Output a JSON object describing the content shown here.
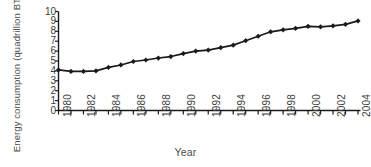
{
  "chart_data": {
    "type": "line",
    "title": "",
    "xlabel": "Year",
    "ylabel": "Energy consumption (quadrillion BTU)",
    "ylabel_lines": [
      "Energy consumption",
      "(quadrillion BTU)"
    ],
    "ylim": [
      0,
      10
    ],
    "xlim": [
      1980,
      2004
    ],
    "grid": false,
    "legend": null,
    "marker": "diamond",
    "line_color": "#1a1a1a",
    "marker_color": "#1a1a1a",
    "y_ticks": [
      10,
      9,
      8,
      7,
      6,
      5,
      4,
      3,
      2,
      1,
      0
    ],
    "x_ticks": [
      1980,
      1982,
      1984,
      1986,
      1988,
      1990,
      1992,
      1994,
      1996,
      1998,
      2000,
      2002,
      2004
    ],
    "x_tick_rotation": -90,
    "x": [
      1980,
      1981,
      1982,
      1983,
      1984,
      1985,
      1986,
      1987,
      1988,
      1989,
      1990,
      1991,
      1992,
      1993,
      1994,
      1995,
      1996,
      1997,
      1998,
      1999,
      2000,
      2001,
      2002,
      2003,
      2004
    ],
    "values": [
      4.1,
      3.95,
      3.95,
      4.0,
      4.35,
      4.6,
      4.95,
      5.1,
      5.3,
      5.45,
      5.75,
      6.0,
      6.1,
      6.35,
      6.6,
      7.05,
      7.5,
      7.95,
      8.15,
      8.3,
      8.5,
      8.45,
      8.55,
      8.7,
      9.05
    ],
    "series": [
      {
        "name": "Energy consumption",
        "values": [
          4.1,
          3.95,
          3.95,
          4.0,
          4.35,
          4.6,
          4.95,
          5.1,
          5.3,
          5.45,
          5.75,
          6.0,
          6.1,
          6.35,
          6.6,
          7.05,
          7.5,
          7.95,
          8.15,
          8.3,
          8.5,
          8.45,
          8.55,
          8.7,
          9.05
        ]
      }
    ]
  }
}
